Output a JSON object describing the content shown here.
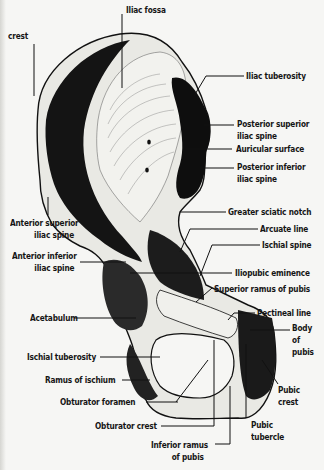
{
  "figure": {
    "labels": {
      "iliac_crest": "crest",
      "iliac_fossa": "Iliac fossa",
      "iliac_tuberosity": "Iliac tuberosity",
      "posterior_superior_iliac_spine": [
        "Posterior superior",
        "iliac spine"
      ],
      "auricular_surface": "Auricular surface",
      "posterior_inferior_iliac_spine": [
        "Posterior inferior",
        "iliac spine"
      ],
      "greater_sciatic_notch": "Greater sciatic notch",
      "arcuate_line": "Arcuate line",
      "ischial_spine": "Ischial spine",
      "anterior_superior_iliac_spine": [
        "Anterior superior",
        "iliac spine"
      ],
      "anterior_inferior_iliac_spine": [
        "Anterior inferior",
        "iliac spine"
      ],
      "iliopubic_eminence": "Iliopubic eminence",
      "superior_ramus_of_pubis": "Superior ramus of pubis",
      "pectineal_line": "Pectineal line",
      "acetabulum": "Acetabulum",
      "body_of_pubis": [
        "Body",
        "of",
        "pubis"
      ],
      "ischial_tuberosity": "Ischial tuberosity",
      "ramus_of_ischium": "Ramus of ischium",
      "obturator_foramen": "Obturator foramen",
      "pubic_crest": [
        "Pubic",
        "crest"
      ],
      "obturator_crest": "Obturator crest",
      "pubic_tubercle": [
        "Pubic",
        "tubercle"
      ],
      "inferior_ramus_of_pubis": [
        "Inferior ramus",
        "of pubis"
      ]
    },
    "colors": {
      "ink": "#111111",
      "paper": "#f6f6f4",
      "bone_light": "#e9e9e4"
    }
  }
}
